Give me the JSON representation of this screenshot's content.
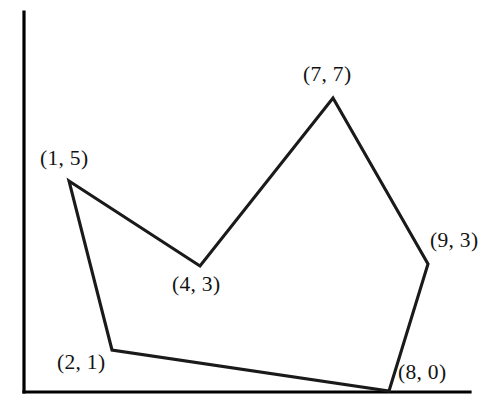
{
  "figure": {
    "type": "geometry-diagram",
    "background_color": "#ffffff",
    "stroke_color": "#1a1a1a",
    "axis_color": "#000000",
    "width": 503,
    "height": 419
  },
  "axes": {
    "y_axis": {
      "name": "y-axis",
      "x": 24,
      "y_top": 12,
      "y_bottom": 392
    },
    "x_axis": {
      "name": "x-axis",
      "y": 392,
      "x_left": 24,
      "x_right": 470
    },
    "tick_labels": [],
    "x_title": "",
    "y_title": ""
  },
  "chart_data": {
    "type": "scatter",
    "xlabel": "",
    "ylabel": "",
    "grid": false,
    "legend": "none",
    "xlim": [
      0,
      10
    ],
    "ylim": [
      0,
      8
    ],
    "closed_path": true,
    "point_labels": [
      "(1, 5)",
      "(4, 3)",
      "(7, 7)",
      "(9, 3)",
      "(8, 0)",
      "(2, 1)"
    ],
    "x": [
      1,
      4,
      7,
      9,
      8,
      2
    ],
    "y": [
      5,
      3,
      7,
      3,
      0,
      1
    ],
    "vertices": [
      {
        "label": "(1, 5)",
        "x": 1,
        "y": 5,
        "px": 69,
        "py": 181,
        "label_px": 40,
        "label_py": 148,
        "label_anchor": "above-left"
      },
      {
        "label": "(4, 3)",
        "x": 4,
        "y": 3,
        "px": 200,
        "py": 266,
        "label_px": 172,
        "label_py": 274,
        "label_anchor": "below"
      },
      {
        "label": "(7, 7)",
        "x": 7,
        "y": 7,
        "px": 333,
        "py": 98,
        "label_px": 303,
        "label_py": 64,
        "label_anchor": "above"
      },
      {
        "label": "(9, 3)",
        "x": 9,
        "y": 3,
        "px": 428,
        "py": 264,
        "label_px": 430,
        "label_py": 230,
        "label_anchor": "right"
      },
      {
        "label": "(8, 0)",
        "x": 8,
        "y": 0,
        "px": 389,
        "py": 391,
        "label_px": 398,
        "label_py": 362,
        "label_anchor": "right"
      },
      {
        "label": "(2, 1)",
        "x": 2,
        "y": 1,
        "px": 112,
        "py": 350,
        "label_px": 57,
        "label_py": 352,
        "label_anchor": "left"
      }
    ],
    "polygon_points_px": "69,181 200,266 333,98 428,264 389,391 112,350"
  }
}
